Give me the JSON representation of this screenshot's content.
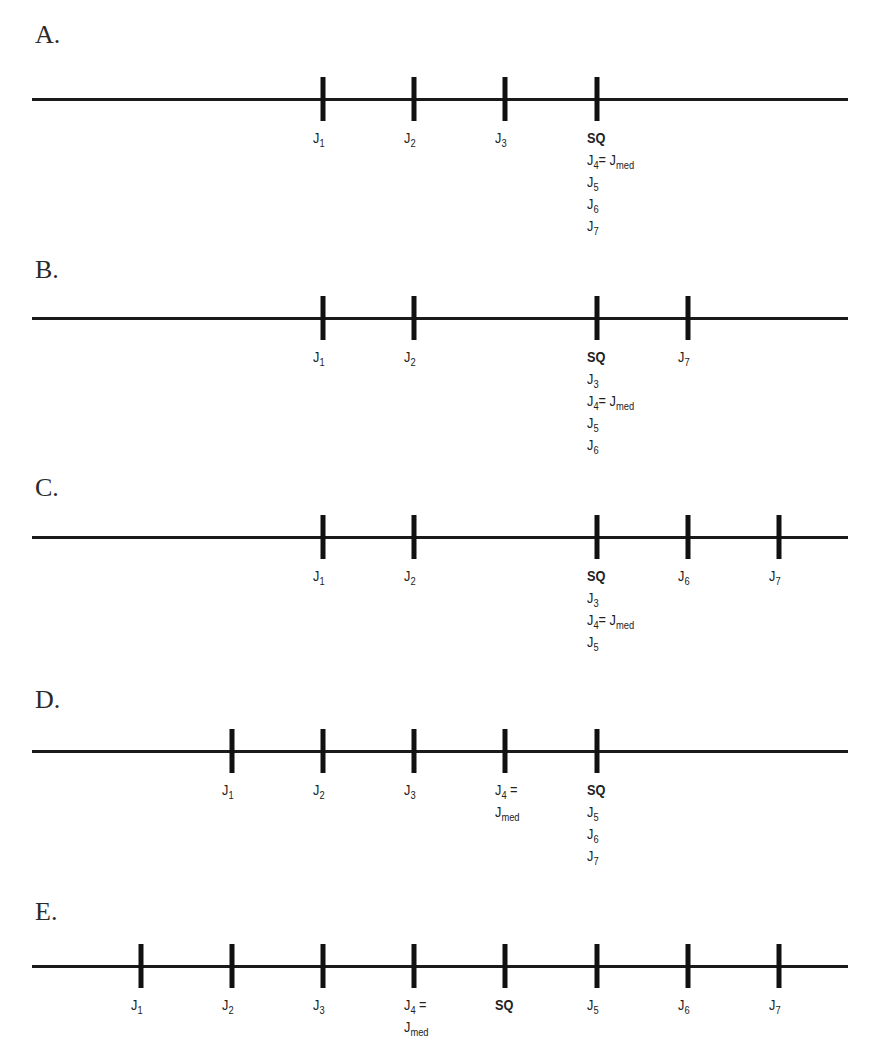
{
  "panels": [
    {
      "label": "A.",
      "top": 20,
      "line_y": 99,
      "ticks": [
        {
          "x": 323,
          "lines": [
            {
              "text": "J",
              "sub": "1"
            }
          ]
        },
        {
          "x": 414,
          "lines": [
            {
              "text": "J",
              "sub": "2"
            }
          ]
        },
        {
          "x": 505,
          "lines": [
            {
              "text": "J",
              "sub": "3"
            }
          ]
        },
        {
          "x": 597,
          "lines": [
            {
              "text": "SQ",
              "bold": true
            },
            {
              "text": "J",
              "sub": "4",
              "after": "= J",
              "sub2": "med"
            },
            {
              "text": "J",
              "sub": "5"
            },
            {
              "text": "J",
              "sub": "6"
            },
            {
              "text": "J",
              "sub": "7"
            }
          ]
        }
      ]
    },
    {
      "label": "B.",
      "top": 255,
      "line_y": 318,
      "ticks": [
        {
          "x": 323,
          "lines": [
            {
              "text": "J",
              "sub": "1"
            }
          ]
        },
        {
          "x": 414,
          "lines": [
            {
              "text": "J",
              "sub": "2"
            }
          ]
        },
        {
          "x": 597,
          "lines": [
            {
              "text": "SQ",
              "bold": true
            },
            {
              "text": "J",
              "sub": "3"
            },
            {
              "text": "J",
              "sub": "4",
              "after": "= J",
              "sub2": "med"
            },
            {
              "text": "J",
              "sub": "5"
            },
            {
              "text": "J",
              "sub": "6"
            }
          ]
        },
        {
          "x": 688,
          "lines": [
            {
              "text": "J",
              "sub": "7"
            }
          ]
        }
      ]
    },
    {
      "label": "C.",
      "top": 473,
      "line_y": 537,
      "ticks": [
        {
          "x": 323,
          "lines": [
            {
              "text": "J",
              "sub": "1"
            }
          ]
        },
        {
          "x": 414,
          "lines": [
            {
              "text": "J",
              "sub": "2"
            }
          ]
        },
        {
          "x": 597,
          "lines": [
            {
              "text": "SQ",
              "bold": true
            },
            {
              "text": "J",
              "sub": "3"
            },
            {
              "text": "J",
              "sub": "4",
              "after": "= J",
              "sub2": "med"
            },
            {
              "text": "J",
              "sub": "5"
            }
          ]
        },
        {
          "x": 688,
          "lines": [
            {
              "text": "J",
              "sub": "6"
            }
          ]
        },
        {
          "x": 779,
          "lines": [
            {
              "text": "J",
              "sub": "7"
            }
          ]
        }
      ]
    },
    {
      "label": "D.",
      "top": 685,
      "line_y": 751,
      "ticks": [
        {
          "x": 232,
          "lines": [
            {
              "text": "J",
              "sub": "1"
            }
          ]
        },
        {
          "x": 323,
          "lines": [
            {
              "text": "J",
              "sub": "2"
            }
          ]
        },
        {
          "x": 414,
          "lines": [
            {
              "text": "J",
              "sub": "3"
            }
          ]
        },
        {
          "x": 505,
          "lines": [
            {
              "text": "J",
              "sub": "4",
              "after": " ="
            },
            {
              "text": "J",
              "sub": "med"
            }
          ]
        },
        {
          "x": 597,
          "lines": [
            {
              "text": "SQ",
              "bold": true
            },
            {
              "text": "J",
              "sub": "5"
            },
            {
              "text": "J",
              "sub": "6"
            },
            {
              "text": "J",
              "sub": "7"
            }
          ]
        }
      ]
    },
    {
      "label": "E.",
      "top": 897,
      "line_y": 966,
      "ticks": [
        {
          "x": 141,
          "lines": [
            {
              "text": "J",
              "sub": "1"
            }
          ]
        },
        {
          "x": 232,
          "lines": [
            {
              "text": "J",
              "sub": "2"
            }
          ]
        },
        {
          "x": 323,
          "lines": [
            {
              "text": "J",
              "sub": "3"
            }
          ]
        },
        {
          "x": 414,
          "lines": [
            {
              "text": "J",
              "sub": "4",
              "after": " ="
            },
            {
              "text": "J",
              "sub": "med"
            }
          ]
        },
        {
          "x": 505,
          "lines": [
            {
              "text": "SQ",
              "bold": true
            }
          ]
        },
        {
          "x": 597,
          "lines": [
            {
              "text": "J",
              "sub": "5"
            }
          ]
        },
        {
          "x": 688,
          "lines": [
            {
              "text": "J",
              "sub": "6"
            }
          ]
        },
        {
          "x": 779,
          "lines": [
            {
              "text": "J",
              "sub": "7"
            }
          ]
        }
      ]
    }
  ]
}
